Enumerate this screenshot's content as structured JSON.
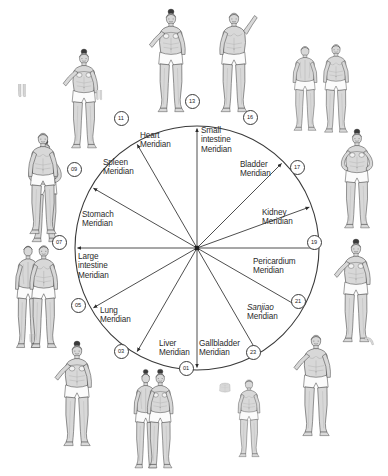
{
  "diagram": {
    "type": "meridian-clock-wheel",
    "title": "",
    "center": {
      "x": 197,
      "y": 248
    },
    "radius": 122,
    "segments": [
      {
        "id": "heart",
        "label": "Heart\nMeridian",
        "italic_word": "",
        "start_hour": 11,
        "end_hour": 13,
        "label_x": 140,
        "label_y": 131,
        "align": "left"
      },
      {
        "id": "small-intestine",
        "label": "Small\nintestine\nMeridian",
        "italic_word": "",
        "start_hour": 13,
        "end_hour": 16,
        "label_x": 201,
        "label_y": 126,
        "align": "left"
      },
      {
        "id": "bladder",
        "label": "Bladder\nMeridian",
        "italic_word": "",
        "start_hour": 16,
        "end_hour": 17,
        "label_x": 240,
        "label_y": 160,
        "align": "left"
      },
      {
        "id": "kidney",
        "label": "Kidney\nMeridian",
        "italic_word": "",
        "start_hour": 17,
        "end_hour": 19,
        "label_x": 262,
        "label_y": 208,
        "align": "left"
      },
      {
        "id": "pericardium",
        "label": "Pericardium\nMeridian",
        "italic_word": "",
        "start_hour": 19,
        "end_hour": 21,
        "label_x": 253,
        "label_y": 257,
        "align": "left"
      },
      {
        "id": "sanjiao",
        "label": "Sanjiao\nMeridian",
        "italic_word": "Sanjiao",
        "start_hour": 21,
        "end_hour": 23,
        "label_x": 247,
        "label_y": 303,
        "align": "left"
      },
      {
        "id": "gallbladder",
        "label": "Gallbladder\nMeridian",
        "italic_word": "",
        "start_hour": 23,
        "end_hour": 1,
        "label_x": 199,
        "label_y": 339,
        "align": "left"
      },
      {
        "id": "liver",
        "label": "Liver\nMeridian",
        "italic_word": "",
        "start_hour": 1,
        "end_hour": 3,
        "label_x": 159,
        "label_y": 339,
        "align": "left"
      },
      {
        "id": "lung",
        "label": "Lung\nMeridian",
        "italic_word": "",
        "start_hour": 3,
        "end_hour": 5,
        "label_x": 100,
        "label_y": 306,
        "align": "left"
      },
      {
        "id": "large-intestine",
        "label": "Large\nintestine\nMeridian",
        "italic_word": "",
        "start_hour": 5,
        "end_hour": 7,
        "label_x": 78,
        "label_y": 252,
        "align": "left"
      },
      {
        "id": "stomach",
        "label": "Stomach\nMeridian",
        "italic_word": "",
        "start_hour": 7,
        "end_hour": 9,
        "label_x": 82,
        "label_y": 210,
        "align": "left"
      },
      {
        "id": "spleen",
        "label": "Spleen\nMeridian",
        "italic_word": "",
        "start_hour": 9,
        "end_hour": 11,
        "label_x": 103,
        "label_y": 158,
        "align": "left"
      }
    ],
    "nodes": [
      {
        "id": "node-13",
        "label": "13",
        "angle_deg": 0,
        "x": 191,
        "y": 100
      },
      {
        "id": "node-16",
        "label": "16",
        "angle_deg": 45,
        "x": 249,
        "y": 116
      },
      {
        "id": "node-17",
        "label": "17",
        "angle_deg": 70,
        "x": 296,
        "y": 166
      },
      {
        "id": "node-19",
        "label": "19",
        "angle_deg": 90,
        "x": 313,
        "y": 241
      },
      {
        "id": "node-21",
        "label": "21",
        "angle_deg": 120,
        "x": 297,
        "y": 300
      },
      {
        "id": "node-23",
        "label": "23",
        "angle_deg": 150,
        "x": 252,
        "y": 351
      },
      {
        "id": "node-01",
        "label": "01",
        "angle_deg": 180,
        "x": 185,
        "y": 367
      },
      {
        "id": "node-03",
        "label": "03",
        "angle_deg": 210,
        "x": 120,
        "y": 350
      },
      {
        "id": "node-05",
        "label": "05",
        "angle_deg": 240,
        "x": 77,
        "y": 304
      },
      {
        "id": "node-07",
        "label": "07",
        "angle_deg": 270,
        "x": 58,
        "y": 241
      },
      {
        "id": "node-09",
        "label": "09",
        "angle_deg": 300,
        "x": 73,
        "y": 168
      },
      {
        "id": "node-11",
        "label": "11",
        "angle_deg": 330,
        "x": 120,
        "y": 117
      }
    ],
    "colors": {
      "stroke": "#3a3a3a",
      "text": "#2b2b2b",
      "background": "#ffffff",
      "figure_fill": "#d8d8d8",
      "figure_shade": "#a9a9a9",
      "figure_line": "#4a4a4a",
      "hair": "#3a3a3a"
    }
  },
  "figures": [
    {
      "id": "figure-front-female-upper-left",
      "pose": "front-female-hands-on-hips",
      "x": 14,
      "y": 138,
      "w": 62,
      "h": 108
    },
    {
      "id": "figure-front-female-top-left",
      "pose": "front-female-arm-out",
      "x": 55,
      "y": 48,
      "w": 58,
      "h": 104
    },
    {
      "id": "figure-front-female-top-mid",
      "pose": "front-female-arm-out",
      "x": 142,
      "y": 8,
      "w": 58,
      "h": 108
    },
    {
      "id": "figure-front-male-top-right",
      "pose": "front-male-arm-raised",
      "x": 205,
      "y": 8,
      "w": 58,
      "h": 108
    },
    {
      "id": "figure-back-male-top-far-right",
      "pose": "back-male-standing",
      "x": 282,
      "y": 40,
      "w": 46,
      "h": 96
    },
    {
      "id": "figure-front-male-top-far-right",
      "pose": "front-male-standing",
      "x": 312,
      "y": 40,
      "w": 48,
      "h": 96
    },
    {
      "id": "figure-front-male-mid-left",
      "pose": "front-male-standing",
      "x": 14,
      "y": 128,
      "w": 58,
      "h": 110
    },
    {
      "id": "figure-pair-male-lower-left",
      "pose": "pair-male-front-back",
      "x": 6,
      "y": 240,
      "w": 62,
      "h": 112
    },
    {
      "id": "figure-front-female-right-upper",
      "pose": "front-female-hands-on-hips",
      "x": 330,
      "y": 128,
      "w": 54,
      "h": 104
    },
    {
      "id": "figure-front-female-right-lower",
      "pose": "front-female-arm-out",
      "x": 328,
      "y": 238,
      "w": 56,
      "h": 108
    },
    {
      "id": "figure-front-female-bot-left",
      "pose": "front-female-arm-out",
      "x": 48,
      "y": 340,
      "w": 58,
      "h": 110
    },
    {
      "id": "figure-pair-female-bot-mid",
      "pose": "pair-female-front-back",
      "x": 124,
      "y": 368,
      "w": 60,
      "h": 104
    },
    {
      "id": "figure-torso-bot-mid",
      "pose": "torso-detail",
      "x": 210,
      "y": 382,
      "w": 30,
      "h": 26
    },
    {
      "id": "figure-side-male-bot-mid",
      "pose": "side-male-standing",
      "x": 228,
      "y": 366,
      "w": 42,
      "h": 104
    },
    {
      "id": "figure-front-male-bot-right",
      "pose": "front-male-arm-out",
      "x": 288,
      "y": 330,
      "w": 56,
      "h": 110
    },
    {
      "id": "figure-legs-top-left-crop",
      "pose": "legs-crop",
      "x": 2,
      "y": 84,
      "w": 40,
      "h": 34
    },
    {
      "id": "figure-legs-top-mid-crop",
      "pose": "legs-crop",
      "x": 88,
      "y": 90,
      "w": 22,
      "h": 26
    },
    {
      "id": "figure-legs-bot-left-crop",
      "pose": "legs-crop",
      "x": 12,
      "y": 334,
      "w": 40,
      "h": 22
    },
    {
      "id": "figure-arm-bot-right-crop",
      "pose": "arm-crop",
      "x": 352,
      "y": 336,
      "w": 34,
      "h": 28
    }
  ]
}
